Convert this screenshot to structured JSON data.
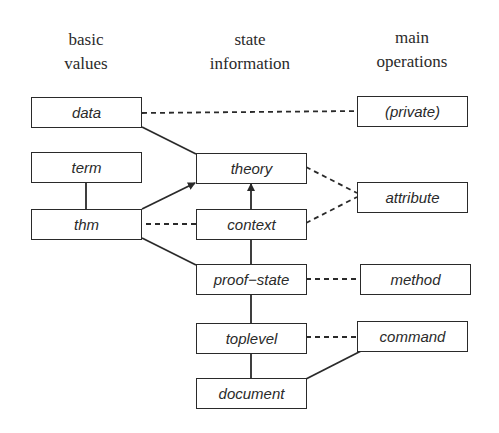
{
  "headers": {
    "basic_values": [
      "basic",
      "values"
    ],
    "state_information": [
      "state",
      "information"
    ],
    "main_operations": [
      "main",
      "operations"
    ]
  },
  "columns": {
    "basic_values": {
      "label": "basic values",
      "boxes": [
        {
          "id": "data",
          "label": "data"
        },
        {
          "id": "term",
          "label": "term"
        },
        {
          "id": "thm",
          "label": "thm"
        }
      ]
    },
    "state_information": {
      "label": "state information",
      "boxes": [
        {
          "id": "theory",
          "label": "theory"
        },
        {
          "id": "context",
          "label": "context"
        },
        {
          "id": "proof_state",
          "label": "proof−state"
        },
        {
          "id": "toplevel",
          "label": "toplevel"
        },
        {
          "id": "document",
          "label": "document"
        }
      ]
    },
    "main_operations": {
      "label": "main operations",
      "boxes": [
        {
          "id": "private",
          "label": "(private)"
        },
        {
          "id": "attribute",
          "label": "attribute"
        },
        {
          "id": "method",
          "label": "method"
        },
        {
          "id": "command",
          "label": "command"
        }
      ]
    }
  },
  "edges": [
    {
      "from": "data",
      "to": "private",
      "style": "dashed"
    },
    {
      "from": "data",
      "to": "theory",
      "style": "solid"
    },
    {
      "from": "term",
      "to": "thm",
      "style": "solid"
    },
    {
      "from": "thm",
      "to": "theory",
      "style": "solid",
      "arrow": "end"
    },
    {
      "from": "thm",
      "to": "context",
      "style": "dashed"
    },
    {
      "from": "thm",
      "to": "proof_state",
      "style": "solid"
    },
    {
      "from": "context",
      "to": "theory",
      "style": "solid",
      "arrow": "end"
    },
    {
      "from": "theory",
      "to": "attribute",
      "style": "dashed"
    },
    {
      "from": "context",
      "to": "attribute",
      "style": "dashed"
    },
    {
      "from": "context",
      "to": "proof_state",
      "style": "solid"
    },
    {
      "from": "proof_state",
      "to": "method",
      "style": "dashed"
    },
    {
      "from": "proof_state",
      "to": "toplevel",
      "style": "solid"
    },
    {
      "from": "toplevel",
      "to": "command",
      "style": "dashed"
    },
    {
      "from": "toplevel",
      "to": "document",
      "style": "solid"
    },
    {
      "from": "command",
      "to": "document",
      "style": "solid"
    }
  ],
  "colors": {
    "stroke": "#2a2a2a",
    "background": "#ffffff"
  }
}
